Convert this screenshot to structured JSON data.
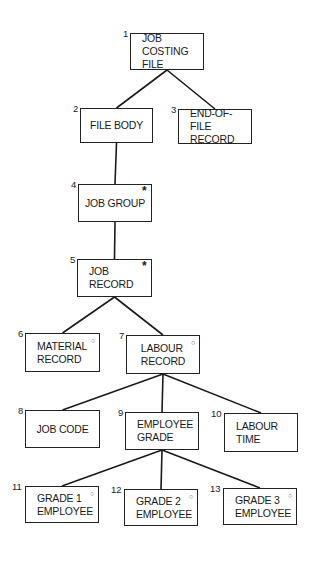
{
  "diagram": {
    "type": "jackson-structure-chart",
    "nodes": [
      {
        "id": "1",
        "number": "1",
        "label": "JOB COSTING\nFILE",
        "marker": "",
        "box": [
          130,
          33,
          74,
          37
        ],
        "align": "left"
      },
      {
        "id": "2",
        "number": "2",
        "label": "FILE BODY",
        "marker": "",
        "box": [
          80,
          108,
          73,
          35
        ],
        "align": "center"
      },
      {
        "id": "3",
        "number": "3",
        "label": "END-OF-FILE\nRECORD",
        "marker": "",
        "box": [
          178,
          109,
          74,
          35
        ],
        "align": "left"
      },
      {
        "id": "4",
        "number": "4",
        "label": "JOB GROUP",
        "marker": "*",
        "box": [
          78,
          184,
          74,
          38
        ],
        "align": "center"
      },
      {
        "id": "5",
        "number": "5",
        "label": "JOB\nRECORD",
        "marker": "*",
        "box": [
          77,
          259,
          75,
          38
        ],
        "align": "left"
      },
      {
        "id": "6",
        "number": "6",
        "label": "MATERIAL\nRECORD",
        "marker": "o",
        "box": [
          25,
          333,
          75,
          39
        ],
        "align": "left"
      },
      {
        "id": "7",
        "number": "7",
        "label": "LABOUR\nRECORD",
        "marker": "o",
        "box": [
          126,
          335,
          74,
          39
        ],
        "align": "center"
      },
      {
        "id": "8",
        "number": "8",
        "label": "JOB CODE",
        "marker": "",
        "box": [
          25,
          410,
          75,
          38
        ],
        "align": "center"
      },
      {
        "id": "9",
        "number": "9",
        "label": "EMPLOYEE\nGRADE",
        "marker": "",
        "box": [
          125,
          412,
          74,
          38
        ],
        "align": "left"
      },
      {
        "id": "10",
        "number": "10",
        "label": "LABOUR\nTIME",
        "marker": "",
        "box": [
          224,
          413,
          74,
          39
        ],
        "align": "left"
      },
      {
        "id": "11",
        "number": "11",
        "label": "GRADE 1\nEMPLOYEE",
        "marker": "o",
        "box": [
          25,
          486,
          74,
          37
        ],
        "align": "left"
      },
      {
        "id": "12",
        "number": "12",
        "label": "GRADE 2\nEMPLOYEE",
        "marker": "o",
        "box": [
          124,
          489,
          74,
          37
        ],
        "align": "left"
      },
      {
        "id": "13",
        "number": "13",
        "label": "GRADE 3\nEMPLOYEE",
        "marker": "o",
        "box": [
          223,
          488,
          74,
          37
        ],
        "align": "left"
      }
    ],
    "edges": [
      {
        "from": "1",
        "to": "2"
      },
      {
        "from": "1",
        "to": "3"
      },
      {
        "from": "2",
        "to": "4"
      },
      {
        "from": "4",
        "to": "5"
      },
      {
        "from": "5",
        "to": "6"
      },
      {
        "from": "5",
        "to": "7"
      },
      {
        "from": "7",
        "to": "8"
      },
      {
        "from": "7",
        "to": "9"
      },
      {
        "from": "7",
        "to": "10"
      },
      {
        "from": "9",
        "to": "11"
      },
      {
        "from": "9",
        "to": "12"
      },
      {
        "from": "9",
        "to": "13"
      }
    ],
    "legend_markers": {
      "*": "iteration",
      "o": "selection"
    }
  }
}
